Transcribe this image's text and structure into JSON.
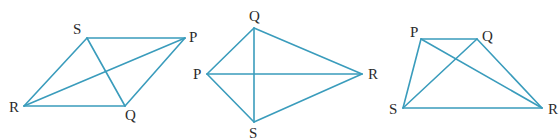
{
  "diagram": {
    "title": "",
    "line_color": "#3a9cbc",
    "label_color": "#2b2b2b",
    "figures": [
      {
        "name": "parallelogram-figure",
        "vertices": [
          "S",
          "P",
          "Q",
          "R"
        ],
        "sides": [
          [
            "S",
            "P"
          ],
          [
            "P",
            "Q"
          ],
          [
            "Q",
            "R"
          ],
          [
            "R",
            "S"
          ]
        ],
        "diagonals": [
          [
            "S",
            "Q"
          ],
          [
            "R",
            "P"
          ]
        ]
      },
      {
        "name": "kite-figure",
        "vertices": [
          "Q",
          "R",
          "S",
          "P"
        ],
        "sides": [
          [
            "Q",
            "R"
          ],
          [
            "R",
            "S"
          ],
          [
            "S",
            "P"
          ],
          [
            "P",
            "Q"
          ]
        ],
        "diagonals": [
          [
            "Q",
            "S"
          ],
          [
            "P",
            "R"
          ]
        ]
      },
      {
        "name": "trapezium-figure",
        "vertices": [
          "P",
          "Q",
          "R",
          "S"
        ],
        "sides": [
          [
            "P",
            "Q"
          ],
          [
            "Q",
            "R"
          ],
          [
            "R",
            "S"
          ],
          [
            "S",
            "P"
          ]
        ],
        "diagonals": [
          [
            "P",
            "R"
          ],
          [
            "Q",
            "S"
          ]
        ]
      }
    ]
  }
}
